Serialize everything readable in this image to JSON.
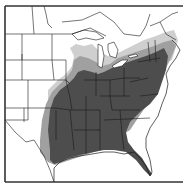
{
  "map": {
    "type": "species-range-map",
    "region": "Eastern North America (United States and southern Canada)",
    "legend": [],
    "colors": {
      "background": "#ffffff",
      "boundary_lines": "#1a1a1a",
      "frame": "#333333",
      "core_range": "#4d4d4d",
      "fringe_range": "#a0a0a0",
      "light_fringe": "#cfcfcf"
    },
    "layers": [
      {
        "name": "core-range",
        "description": "Dark gray shaded range covering the eastern and southeastern United States from eastern Texas/Oklahoma to the Atlantic coast and north to the Great Lakes and New England"
      },
      {
        "name": "fringe-range",
        "description": "Light gray shaded band along the western and northern edges of the core range (eastern Kansas/Oklahoma/Texas, Iowa, Wisconsin, Michigan, southern Ontario, New England)"
      },
      {
        "name": "state-boundaries",
        "description": "Thin black state and provincial boundary lines"
      },
      {
        "name": "frame",
        "description": "Border on left, top, and bottom edges"
      }
    ]
  }
}
